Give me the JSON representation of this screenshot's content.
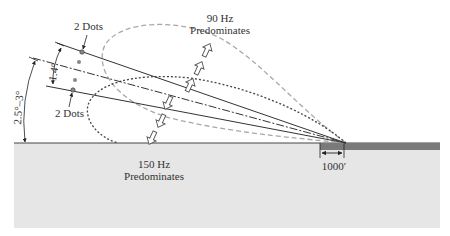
{
  "diagram": {
    "labels": {
      "upper_dots": "2 Dots",
      "lower_dots": "2 Dots",
      "hz90_line1": "90 Hz",
      "hz90_line2": "Predominates",
      "hz150_line1": "150 Hz",
      "hz150_line2": "Predominates",
      "angle_width": "1.4°",
      "angle_glide": "2.5°–3°",
      "distance": "1000′"
    },
    "colors": {
      "ground": "#e6e6e6",
      "runway": "#7a7a7a",
      "line": "#333333",
      "lobe_90": "#a8a8a8",
      "lobe_150": "#444444"
    },
    "elements": {
      "lobe_90hz": "gray dashed lobe (90 Hz)",
      "lobe_150hz": "dark dotted lobe (150 Hz)",
      "glide_path_centerline": "dash-dot line",
      "upper_limit": "solid line (2 dots above)",
      "lower_limit": "solid line (2 dots below)",
      "arrows_up_count": 3,
      "arrows_down_count": 3
    }
  }
}
